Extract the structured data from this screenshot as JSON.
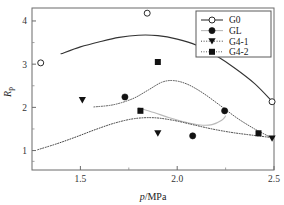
{
  "chart_data": {
    "type": "scatter",
    "title": "",
    "xlabel": "p/MPa",
    "ylabel": "Rp",
    "xlabel_parts": {
      "italic": "p",
      "rest": "/MPa"
    },
    "ylabel_parts": {
      "italic": "R",
      "sub": "p"
    },
    "xlim": [
      1.25,
      2.5
    ],
    "ylim": [
      0.55,
      4.3
    ],
    "xticks": [
      1.5,
      2.0,
      2.5
    ],
    "xtick_labels": [
      "1.5",
      "2.0",
      "2.5"
    ],
    "xminor_ticks": [
      1.75,
      2.25
    ],
    "yticks": [
      1,
      2,
      3,
      4
    ],
    "ytick_labels": [
      "1",
      "2",
      "3",
      "4"
    ],
    "yminor_ticks": [
      1.5,
      2.5,
      3.5,
      0.75
    ],
    "grid": false,
    "legend_position": "top-right",
    "series": [
      {
        "name": "G0",
        "marker": "open-circle",
        "line": "solid",
        "color": "#333333",
        "points": [
          {
            "x": 1.295,
            "y": 3.03
          },
          {
            "x": 1.845,
            "y": 4.18
          },
          {
            "x": 2.49,
            "y": 2.13
          }
        ],
        "curve": [
          {
            "x": 1.4,
            "y": 3.24
          },
          {
            "x": 1.5,
            "y": 3.4
          },
          {
            "x": 1.6,
            "y": 3.52
          },
          {
            "x": 1.7,
            "y": 3.62
          },
          {
            "x": 1.8,
            "y": 3.67
          },
          {
            "x": 1.9,
            "y": 3.66
          },
          {
            "x": 2.0,
            "y": 3.58
          },
          {
            "x": 2.1,
            "y": 3.44
          },
          {
            "x": 2.2,
            "y": 3.2
          },
          {
            "x": 2.3,
            "y": 2.9
          },
          {
            "x": 2.4,
            "y": 2.55
          },
          {
            "x": 2.49,
            "y": 2.14
          }
        ]
      },
      {
        "name": "GL",
        "marker": "filled-circle",
        "line": "solid-light",
        "color": "#b9b9b9",
        "points": [
          {
            "x": 1.73,
            "y": 2.24
          },
          {
            "x": 2.08,
            "y": 1.34
          },
          {
            "x": 2.245,
            "y": 1.92
          }
        ],
        "curve": [
          {
            "x": 1.8,
            "y": 1.99
          },
          {
            "x": 1.88,
            "y": 1.88
          },
          {
            "x": 1.96,
            "y": 1.76
          },
          {
            "x": 2.04,
            "y": 1.66
          },
          {
            "x": 2.12,
            "y": 1.59
          },
          {
            "x": 2.18,
            "y": 1.6
          },
          {
            "x": 2.23,
            "y": 1.7
          },
          {
            "x": 2.25,
            "y": 1.8
          }
        ]
      },
      {
        "name": "G4-1",
        "marker": "filled-triangle-down",
        "line": "dotted",
        "color": "#2b2b2b",
        "points": [
          {
            "x": 1.51,
            "y": 2.17
          },
          {
            "x": 1.9,
            "y": 1.4
          },
          {
            "x": 2.49,
            "y": 1.28
          }
        ],
        "curve": [
          {
            "x": 1.28,
            "y": 1.02
          },
          {
            "x": 1.38,
            "y": 1.16
          },
          {
            "x": 1.48,
            "y": 1.32
          },
          {
            "x": 1.58,
            "y": 1.49
          },
          {
            "x": 1.68,
            "y": 1.64
          },
          {
            "x": 1.78,
            "y": 1.74
          },
          {
            "x": 1.88,
            "y": 1.76
          },
          {
            "x": 1.98,
            "y": 1.7
          },
          {
            "x": 2.08,
            "y": 1.6
          },
          {
            "x": 2.18,
            "y": 1.5
          },
          {
            "x": 2.28,
            "y": 1.42
          },
          {
            "x": 2.38,
            "y": 1.36
          },
          {
            "x": 2.49,
            "y": 1.3
          }
        ]
      },
      {
        "name": "G4-2",
        "marker": "filled-square",
        "line": "dash-dot",
        "color": "#4a4a4a",
        "points": [
          {
            "x": 1.9,
            "y": 3.05
          },
          {
            "x": 1.81,
            "y": 1.92
          },
          {
            "x": 2.42,
            "y": 1.4
          }
        ],
        "curve": [
          {
            "x": 1.57,
            "y": 2.01
          },
          {
            "x": 1.67,
            "y": 2.06
          },
          {
            "x": 1.77,
            "y": 2.2
          },
          {
            "x": 1.85,
            "y": 2.4
          },
          {
            "x": 1.92,
            "y": 2.58
          },
          {
            "x": 1.98,
            "y": 2.62
          },
          {
            "x": 2.05,
            "y": 2.54
          },
          {
            "x": 2.13,
            "y": 2.34
          },
          {
            "x": 2.22,
            "y": 2.05
          },
          {
            "x": 2.31,
            "y": 1.75
          },
          {
            "x": 2.4,
            "y": 1.5
          },
          {
            "x": 2.49,
            "y": 1.29
          }
        ]
      }
    ]
  },
  "legend": {
    "entries": [
      {
        "label": "G0"
      },
      {
        "label": "GL"
      },
      {
        "label": "G4-1"
      },
      {
        "label": "G4-2"
      }
    ]
  }
}
